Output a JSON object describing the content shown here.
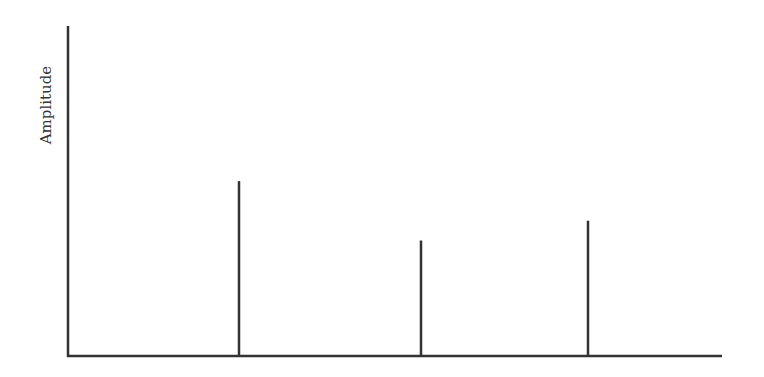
{
  "chart_data": {
    "type": "bar",
    "title": "",
    "xlabel": "",
    "ylabel": "Amplitude",
    "style": "stem",
    "categories": [
      "f1",
      "f2",
      "f3"
    ],
    "x_positions_px": [
      239,
      421,
      588
    ],
    "values": [
      0.53,
      0.35,
      0.41
    ],
    "ylim": [
      0,
      1
    ],
    "grid": false,
    "legend": null,
    "tick_labels": false
  },
  "colors": {
    "axis": "#333333",
    "stem": "#333333"
  },
  "plot": {
    "x0": 68,
    "y0": 356,
    "x1": 722,
    "ytop": 26
  }
}
